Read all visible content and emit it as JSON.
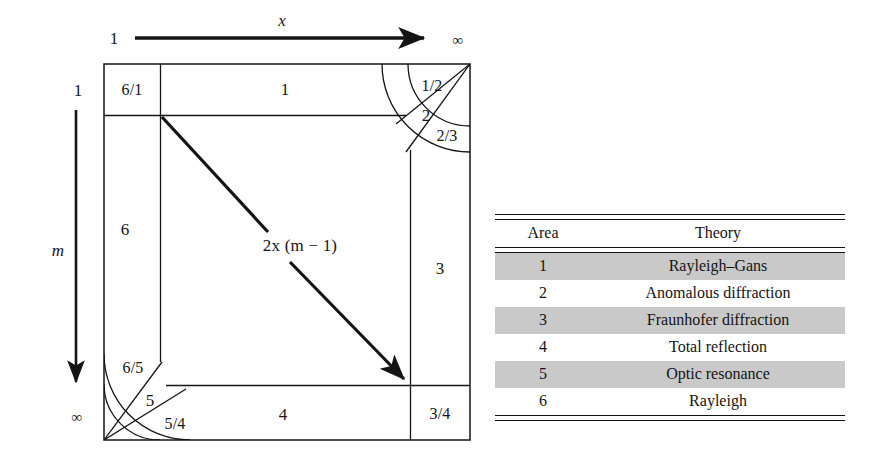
{
  "figure": {
    "axes": {
      "x_axis": {
        "variable": "x",
        "start_label": "1",
        "end_label": "∞",
        "arrow": "right-arrow-icon"
      },
      "y_axis": {
        "variable": "m",
        "start_label": "1",
        "end_label": "∞",
        "arrow": "down-arrow-icon"
      }
    },
    "diagonal": {
      "label": "2x (m − 1)",
      "arrow": "diagonal-arrow-icon"
    },
    "regions": [
      {
        "id": "region-6-1",
        "label": "6/1"
      },
      {
        "id": "region-1",
        "label": "1"
      },
      {
        "id": "region-1-2",
        "label": "1/2"
      },
      {
        "id": "region-2",
        "label": "2"
      },
      {
        "id": "region-2-3",
        "label": "2/3"
      },
      {
        "id": "region-6",
        "label": "6"
      },
      {
        "id": "region-3",
        "label": "3"
      },
      {
        "id": "region-6-5",
        "label": "6/5"
      },
      {
        "id": "region-5",
        "label": "5"
      },
      {
        "id": "region-5-4",
        "label": "5/4"
      },
      {
        "id": "region-4",
        "label": "4"
      },
      {
        "id": "region-3-4",
        "label": "3/4"
      }
    ]
  },
  "table": {
    "columns": [
      "Area",
      "Theory"
    ],
    "rows": [
      {
        "area": "1",
        "theory": "Rayleigh–Gans",
        "shaded": true
      },
      {
        "area": "2",
        "theory": "Anomalous diffraction",
        "shaded": false
      },
      {
        "area": "3",
        "theory": "Fraunhofer diffraction",
        "shaded": true
      },
      {
        "area": "4",
        "theory": "Total reflection",
        "shaded": false
      },
      {
        "area": "5",
        "theory": "Optic resonance",
        "shaded": true
      },
      {
        "area": "6",
        "theory": "Rayleigh",
        "shaded": false
      }
    ]
  },
  "colors": {
    "ink": "#141414",
    "shade": "#c9c9c9",
    "background": "#ffffff"
  }
}
